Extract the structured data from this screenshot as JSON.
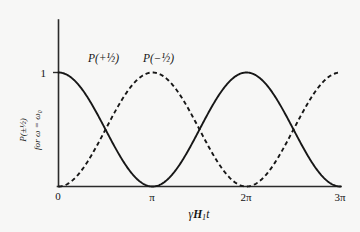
{
  "figure": {
    "background_color": "#f7f7f6",
    "ink_color": "#171717"
  },
  "axes": {
    "y_label_line1": "P(±½)",
    "y_label_line2": "for ω = ω₀",
    "y_tick_label": "1",
    "x_label": "γH₁t",
    "x_tick_labels": [
      "0",
      "π",
      "2π",
      "3π"
    ]
  },
  "annotations": {
    "solid_curve_label": "P(+½)",
    "dashed_curve_label": "P(−½)"
  },
  "chart_data": {
    "type": "line",
    "title": "",
    "subtitle": "",
    "xlabel": "γH₁t",
    "ylabel": "P(±½) for ω = ω₀",
    "xlim": [
      0,
      9.42477796
    ],
    "ylim": [
      0,
      1.0
    ],
    "xticks": [
      0,
      3.14159265,
      6.28318531,
      9.42477796
    ],
    "xticklabels": [
      "0",
      "π",
      "2π",
      "3π"
    ],
    "yticks": [
      1
    ],
    "yticklabels": [
      "1"
    ],
    "grid": false,
    "legend": "inline-annotations",
    "series": [
      {
        "name": "P(+½)",
        "style": "solid",
        "formula": "cos^2(γH₁t/2)",
        "x": [
          0,
          0.3927,
          0.7854,
          1.1781,
          1.5708,
          1.9635,
          2.3562,
          2.7489,
          3.1416,
          3.5343,
          3.927,
          4.3197,
          4.7124,
          5.1051,
          5.4978,
          5.8905,
          6.2832,
          6.6759,
          7.0686,
          7.4613,
          7.854,
          8.2467,
          8.6394,
          9.0321,
          9.4248
        ],
        "y": [
          1.0,
          0.9619,
          0.8536,
          0.6913,
          0.5,
          0.3087,
          0.1464,
          0.0381,
          0.0,
          0.0381,
          0.1464,
          0.3087,
          0.5,
          0.6913,
          0.8536,
          0.9619,
          1.0,
          0.9619,
          0.8536,
          0.6913,
          0.5,
          0.3087,
          0.1464,
          0.0381,
          0.0
        ]
      },
      {
        "name": "P(−½)",
        "style": "dashed",
        "formula": "sin^2(γH₁t/2)",
        "x": [
          0,
          0.3927,
          0.7854,
          1.1781,
          1.5708,
          1.9635,
          2.3562,
          2.7489,
          3.1416,
          3.5343,
          3.927,
          4.3197,
          4.7124,
          5.1051,
          5.4978,
          5.8905,
          6.2832,
          6.6759,
          7.0686,
          7.4613,
          7.854,
          8.2467,
          8.6394,
          9.0321,
          9.4248
        ],
        "y": [
          0.0,
          0.0381,
          0.1464,
          0.3087,
          0.5,
          0.6913,
          0.8536,
          0.9619,
          1.0,
          0.9619,
          0.8536,
          0.6913,
          0.5,
          0.3087,
          0.1464,
          0.0381,
          0.0,
          0.0381,
          0.1464,
          0.3087,
          0.5,
          0.6913,
          0.8536,
          0.9619,
          1.0
        ]
      }
    ],
    "annotations": [
      {
        "text": "P(+½)",
        "x": 1.0,
        "y": 0.95
      },
      {
        "text": "P(−½)",
        "x": 3.2,
        "y": 0.95
      }
    ]
  }
}
